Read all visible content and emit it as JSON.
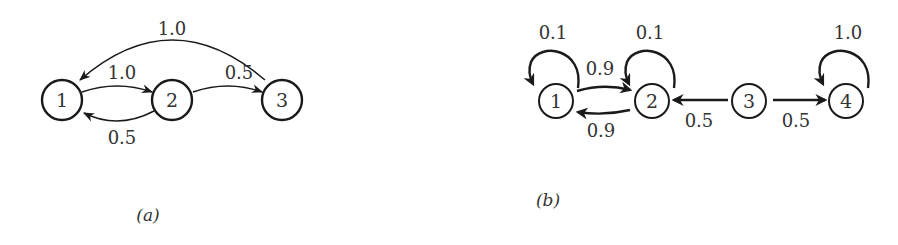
{
  "diagram_a": {
    "caption": "(a)",
    "nodes": [
      {
        "id": "1",
        "label": "1"
      },
      {
        "id": "2",
        "label": "2"
      },
      {
        "id": "3",
        "label": "3"
      }
    ],
    "edges": [
      {
        "from": "3",
        "to": "1",
        "weight": "1.0"
      },
      {
        "from": "1",
        "to": "2",
        "weight": "1.0"
      },
      {
        "from": "2",
        "to": "3",
        "weight": "0.5"
      },
      {
        "from": "2",
        "to": "1",
        "weight": "0.5"
      }
    ]
  },
  "diagram_b": {
    "caption": "(b)",
    "nodes": [
      {
        "id": "1",
        "label": "1"
      },
      {
        "id": "2",
        "label": "2"
      },
      {
        "id": "3",
        "label": "3"
      },
      {
        "id": "4",
        "label": "4"
      }
    ],
    "edges": [
      {
        "from": "1",
        "to": "1",
        "weight": "0.1"
      },
      {
        "from": "2",
        "to": "2",
        "weight": "0.1"
      },
      {
        "from": "4",
        "to": "4",
        "weight": "1.0"
      },
      {
        "from": "1",
        "to": "2",
        "weight": "0.9"
      },
      {
        "from": "2",
        "to": "1",
        "weight": "0.9"
      },
      {
        "from": "3",
        "to": "2",
        "weight": "0.5"
      },
      {
        "from": "3",
        "to": "4",
        "weight": "0.5"
      }
    ]
  }
}
